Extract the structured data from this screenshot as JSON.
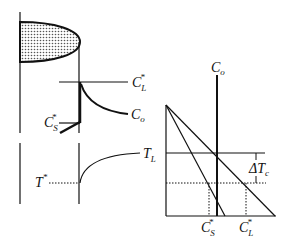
{
  "diagram": {
    "title": "",
    "labels": {
      "cl_star": {
        "base": "C",
        "sub": "L",
        "sup": "*"
      },
      "co_profile": {
        "base": "C",
        "sub": "o"
      },
      "cs_star": {
        "base": "C",
        "sub": "S",
        "sup": "*"
      },
      "t_star": {
        "base": "T",
        "sup": "*"
      },
      "t_l": {
        "base": "T",
        "sub": "L"
      },
      "co_phase": {
        "base": "C",
        "sub": "o"
      },
      "delta_tc": {
        "base": "ΔT",
        "sub": "c"
      },
      "cs_star_axis": {
        "base": "C",
        "sub": "S",
        "sup": "*"
      },
      "cl_star_axis": {
        "base": "C",
        "sub": "L",
        "sup": "*"
      }
    },
    "panels": [
      "solid-liquid interface with shaded solid region",
      "solute concentration profile ahead of interface",
      "temperature profile ahead of interface",
      "phase diagram with liquidus and solidus lines"
    ],
    "colors": {
      "line": "#111111",
      "fill_dots": "#555555",
      "background": "#ffffff"
    }
  }
}
